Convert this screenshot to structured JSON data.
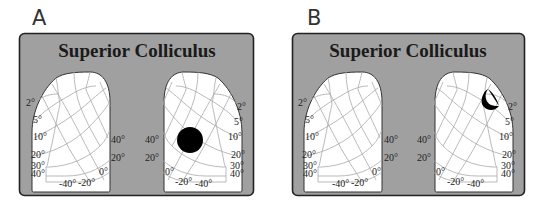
{
  "panels": [
    {
      "letter": "A",
      "title": "Superior Colliculus",
      "left_colliculus": {
        "eccentricity_labels": [
          "2°",
          "5°",
          "10°",
          "20°",
          "30°",
          "40°"
        ],
        "elevation_labels_right": [
          "40°",
          "20°",
          "0°"
        ],
        "elevation_labels_bottom": [
          "-40°",
          "-20°"
        ]
      },
      "right_colliculus": {
        "eccentricity_labels": [
          "2°",
          "5°",
          "10°",
          "20°",
          "30°",
          "40°"
        ],
        "elevation_labels_left": [
          "40°",
          "20°",
          "0°"
        ],
        "elevation_labels_bottom": [
          "-20°",
          "-40°"
        ],
        "activity_marker": {
          "shape": "circle",
          "cx": 190,
          "cy": 140,
          "r": 13,
          "color": "#000000"
        }
      }
    },
    {
      "letter": "B",
      "title": "Superior Colliculus",
      "left_colliculus": {
        "eccentricity_labels": [
          "2°",
          "5°",
          "10°",
          "20°",
          "30°",
          "40°"
        ],
        "elevation_labels_right": [
          "40°",
          "20°",
          "0°"
        ],
        "elevation_labels_bottom": [
          "-40°",
          "-20°"
        ]
      },
      "right_colliculus": {
        "eccentricity_labels": [
          "2°",
          "5°",
          "10°",
          "20°",
          "30°",
          "40°"
        ],
        "elevation_labels_left": [
          "40°",
          "20°",
          "0°"
        ],
        "elevation_labels_bottom": [
          "-20°",
          "-40°"
        ],
        "activity_marker": {
          "shape": "crescent",
          "color": "#000000"
        }
      }
    }
  ],
  "colors": {
    "box_background": "#a0a0a0",
    "colliculus_fill": "#ffffff",
    "grid_lines": "#a8a8a8",
    "marker": "#000000"
  }
}
